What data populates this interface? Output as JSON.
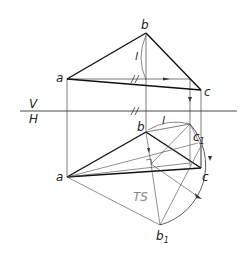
{
  "figure": {
    "type": "descriptive-geometry-projection",
    "planes": {
      "upper": "V",
      "lower": "H"
    },
    "labels": {
      "a_v": "a",
      "b_v": "b",
      "c_v": "c",
      "l_v": "l",
      "a_h": "a",
      "b_h": "b",
      "c_h": "c",
      "c1_h": "c",
      "c1_sub": "1",
      "b1_h": "b",
      "b1_sub": "1",
      "l_h": "l",
      "ts": "TS",
      "plane_v": "V",
      "plane_h": "H"
    },
    "colors": {
      "stroke": "#222222",
      "thin": "#444444",
      "ts_text": "#888888",
      "background": "#ffffff"
    }
  }
}
